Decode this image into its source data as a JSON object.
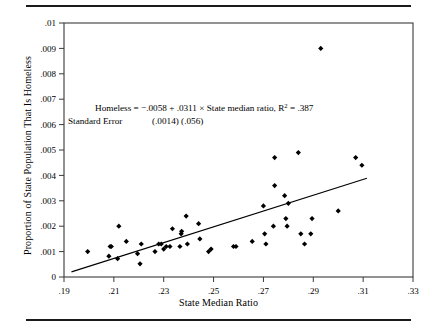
{
  "figure": {
    "top_rule": true,
    "bottom_rule": true
  },
  "chart_data": {
    "type": "scatter",
    "title": "",
    "xlabel": "State Median Ratio",
    "ylabel": "Proportion of State Population That Is Homeless",
    "xlim": [
      0.19,
      0.33
    ],
    "ylim": [
      0.0,
      0.01
    ],
    "grid": false,
    "legend": null,
    "xticks": [
      0.19,
      0.21,
      0.23,
      0.25,
      0.27,
      0.29,
      0.31,
      0.33
    ],
    "xticklabels": [
      ".19",
      ".21",
      ".23",
      ".25",
      ".27",
      ".29",
      ".31",
      ".33"
    ],
    "yticks": [
      0,
      0.001,
      0.002,
      0.003,
      0.004,
      0.005,
      0.006,
      0.007,
      0.008,
      0.009,
      0.01
    ],
    "yticklabels": [
      "0",
      ".001",
      ".002",
      ".003",
      ".004",
      ".005",
      ".006",
      ".007",
      ".008",
      ".009",
      ".01"
    ],
    "marker": "diamond",
    "marker_color": "#000000",
    "points": [
      {
        "x": 0.1995,
        "y": 0.001
      },
      {
        "x": 0.2085,
        "y": 0.0012
      },
      {
        "x": 0.209,
        "y": 0.0012
      },
      {
        "x": 0.208,
        "y": 0.00082
      },
      {
        "x": 0.2115,
        "y": 0.00072
      },
      {
        "x": 0.212,
        "y": 0.002
      },
      {
        "x": 0.215,
        "y": 0.0014
      },
      {
        "x": 0.2195,
        "y": 0.00092
      },
      {
        "x": 0.221,
        "y": 0.0013
      },
      {
        "x": 0.2205,
        "y": 0.00052
      },
      {
        "x": 0.2265,
        "y": 0.001
      },
      {
        "x": 0.228,
        "y": 0.0013
      },
      {
        "x": 0.229,
        "y": 0.0013
      },
      {
        "x": 0.23,
        "y": 0.0011
      },
      {
        "x": 0.231,
        "y": 0.0012
      },
      {
        "x": 0.2325,
        "y": 0.0012
      },
      {
        "x": 0.2335,
        "y": 0.0019
      },
      {
        "x": 0.2365,
        "y": 0.0012
      },
      {
        "x": 0.237,
        "y": 0.0017
      },
      {
        "x": 0.2372,
        "y": 0.0018
      },
      {
        "x": 0.239,
        "y": 0.0024
      },
      {
        "x": 0.2395,
        "y": 0.0013
      },
      {
        "x": 0.244,
        "y": 0.0021
      },
      {
        "x": 0.2445,
        "y": 0.0015
      },
      {
        "x": 0.248,
        "y": 0.001
      },
      {
        "x": 0.249,
        "y": 0.0011
      },
      {
        "x": 0.258,
        "y": 0.0012
      },
      {
        "x": 0.259,
        "y": 0.0012
      },
      {
        "x": 0.2655,
        "y": 0.0014
      },
      {
        "x": 0.27,
        "y": 0.0028
      },
      {
        "x": 0.2705,
        "y": 0.0017
      },
      {
        "x": 0.271,
        "y": 0.0013
      },
      {
        "x": 0.274,
        "y": 0.002
      },
      {
        "x": 0.2745,
        "y": 0.0047
      },
      {
        "x": 0.2745,
        "y": 0.0036
      },
      {
        "x": 0.2785,
        "y": 0.0032
      },
      {
        "x": 0.279,
        "y": 0.0023
      },
      {
        "x": 0.2795,
        "y": 0.002
      },
      {
        "x": 0.28,
        "y": 0.0029
      },
      {
        "x": 0.284,
        "y": 0.0049
      },
      {
        "x": 0.285,
        "y": 0.0017
      },
      {
        "x": 0.2865,
        "y": 0.0013
      },
      {
        "x": 0.2895,
        "y": 0.0023
      },
      {
        "x": 0.289,
        "y": 0.0017
      },
      {
        "x": 0.293,
        "y": 0.009
      },
      {
        "x": 0.3,
        "y": 0.0026
      },
      {
        "x": 0.307,
        "y": 0.0047
      },
      {
        "x": 0.3095,
        "y": 0.0044
      }
    ],
    "regression_line": {
      "intercept": -0.0058,
      "slope": 0.0311,
      "x_start": 0.193,
      "x_end": 0.3115,
      "color": "#000000"
    },
    "annotations": [
      {
        "id": "equation",
        "text": "Homeless = −.0058 + .0311 × State median ratio, R",
        "superscript": "2",
        "tail": " = .387"
      },
      {
        "id": "standard-error-label",
        "text": "Standard Error"
      },
      {
        "id": "standard-error-values",
        "text": "(.0014) (.056)"
      }
    ]
  }
}
